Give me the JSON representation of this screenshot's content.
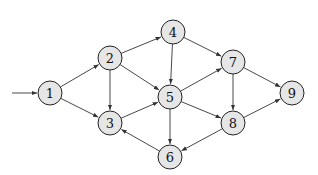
{
  "graph": {
    "type": "directed",
    "start_node": "1",
    "nodes": [
      {
        "id": "1",
        "label": "1",
        "x": 50,
        "y": 93
      },
      {
        "id": "2",
        "label": "2",
        "x": 110,
        "y": 58
      },
      {
        "id": "3",
        "label": "3",
        "x": 110,
        "y": 123
      },
      {
        "id": "4",
        "label": "4",
        "x": 173,
        "y": 32
      },
      {
        "id": "5",
        "label": "5",
        "x": 170,
        "y": 97
      },
      {
        "id": "6",
        "label": "6",
        "x": 170,
        "y": 157
      },
      {
        "id": "7",
        "label": "7",
        "x": 233,
        "y": 62
      },
      {
        "id": "8",
        "label": "8",
        "x": 233,
        "y": 123
      },
      {
        "id": "9",
        "label": "9",
        "x": 292,
        "y": 93
      }
    ],
    "edges": [
      {
        "from": "1",
        "to": "2"
      },
      {
        "from": "1",
        "to": "3"
      },
      {
        "from": "2",
        "to": "3"
      },
      {
        "from": "2",
        "to": "4"
      },
      {
        "from": "2",
        "to": "5"
      },
      {
        "from": "3",
        "to": "5"
      },
      {
        "from": "4",
        "to": "5"
      },
      {
        "from": "4",
        "to": "7"
      },
      {
        "from": "5",
        "to": "6"
      },
      {
        "from": "5",
        "to": "7"
      },
      {
        "from": "5",
        "to": "8"
      },
      {
        "from": "6",
        "to": "3"
      },
      {
        "from": "7",
        "to": "8"
      },
      {
        "from": "7",
        "to": "9"
      },
      {
        "from": "8",
        "to": "6"
      },
      {
        "from": "8",
        "to": "9"
      }
    ],
    "colors": {
      "node_fill": "#e6e6e6",
      "stroke": "#222222"
    }
  }
}
